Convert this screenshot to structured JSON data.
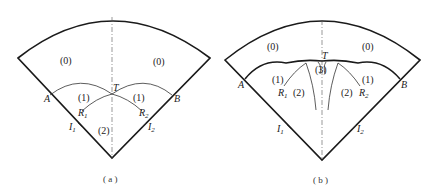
{
  "diagrams": [
    {
      "id": "a",
      "caption": "( a )",
      "regions": {
        "left_outer": "(0)",
        "right_outer": "(0)",
        "left_mid": "(1)",
        "right_mid": "(1)",
        "bottom": "(2)"
      },
      "points": {
        "A": "A",
        "B": "B",
        "T": "T",
        "R1": "R",
        "R1_sub": "1",
        "R2": "R",
        "R2_sub": "2",
        "I1": "I",
        "I1_sub": "1",
        "I2": "I",
        "I2_sub": "2"
      }
    },
    {
      "id": "b",
      "caption": "( b )",
      "regions": {
        "left_outer": "(0)",
        "right_outer": "(0)",
        "left_mid": "(1)",
        "right_mid": "(1)",
        "left_lower": "(2)",
        "right_lower": "(2)",
        "center": "(3)"
      },
      "points": {
        "A": "A",
        "B": "B",
        "T": "T",
        "R1": "R",
        "R1_sub": "1",
        "R2": "R",
        "R2_sub": "2",
        "I1": "I",
        "I1_sub": "1",
        "I2": "I",
        "I2_sub": "2"
      }
    }
  ]
}
